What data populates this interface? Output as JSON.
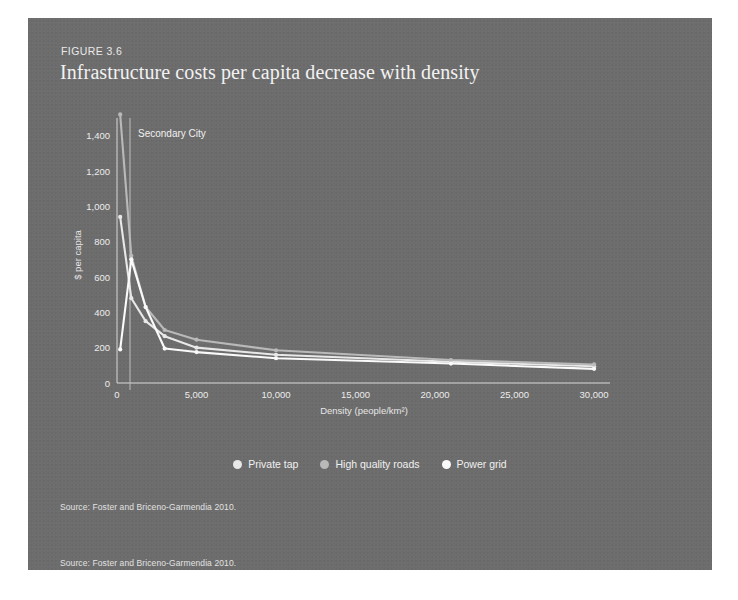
{
  "figure": {
    "label": "FIGURE 3.6",
    "title": "Infrastructure costs per capita decrease with density",
    "source_note_1": "Source: Foster and Briceno-Garmendia 2010.",
    "source_note_2": "Source: Foster and Briceno-Garmendia 2010."
  },
  "colors": {
    "panel_background": "#6d6d6d",
    "title_text": "#f2f2f2",
    "axis": "#d8d8d8",
    "private_tap": "#e8e8e8",
    "high_quality_roads": "#b9b9b9",
    "power_grid": "#fafafa",
    "reference_line": "#bdbdbd"
  },
  "chart_data": {
    "type": "line",
    "title": "Infrastructure costs per capita decrease with density",
    "xlabel": "Density (people/km²)",
    "ylabel": "$ per capita",
    "xlim": [
      0,
      31000
    ],
    "ylim": [
      0,
      1500
    ],
    "xticks": [
      0,
      5000,
      10000,
      15000,
      20000,
      25000,
      30000
    ],
    "xticklabels": [
      "0",
      "5,000",
      "10,000",
      "15,000",
      "20,000",
      "25,000",
      "30,000"
    ],
    "yticks": [
      0,
      200,
      400,
      600,
      800,
      1000,
      1200,
      1400
    ],
    "yticklabels": [
      "0",
      "200",
      "400",
      "600",
      "800",
      "1,000",
      "1,200",
      "1,400"
    ],
    "grid": false,
    "legend_position": "bottom",
    "annotations": [
      {
        "text": "Secondary City",
        "x": 900,
        "y": 1400,
        "vline_x": 900
      }
    ],
    "x": [
      200,
      900,
      1800,
      3000,
      5000,
      10000,
      21000,
      30000
    ],
    "series": [
      {
        "name": "Private tap",
        "color": "#e8e8e8",
        "values": [
          940,
          480,
          350,
          265,
          200,
          160,
          120,
          95
        ]
      },
      {
        "name": "High quality roads",
        "color": "#b9b9b9",
        "values": [
          1520,
          720,
          430,
          300,
          245,
          185,
          130,
          105
        ]
      },
      {
        "name": "Power grid",
        "color": "#fafafa",
        "values": [
          190,
          700,
          430,
          195,
          175,
          140,
          110,
          80
        ]
      }
    ]
  },
  "legend": [
    {
      "label": "Private tap",
      "color": "#e8e8e8",
      "marker": "circle"
    },
    {
      "label": "High quality roads",
      "color": "#b9b9b9",
      "marker": "circle"
    },
    {
      "label": "Power grid",
      "color": "#fafafa",
      "marker": "circle"
    }
  ]
}
